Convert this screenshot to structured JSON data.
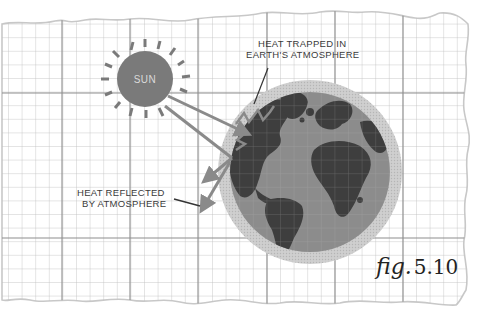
{
  "diagram": {
    "type": "greenhouse-effect-illustration",
    "background": "torn graph paper",
    "sun": {
      "label": "SUN",
      "color": "#7a7a7a",
      "label_color": "#d9d9d9"
    },
    "earth": {
      "ocean_color": "#8c8c8c",
      "land_color": "#3e3e3e",
      "atmosphere_color": "#c9c9c9"
    },
    "arrows_color": "#8a8a8a",
    "grid": {
      "line_color": "#b9b9b9",
      "major_line_color": "#8e8e8e"
    }
  },
  "labels": {
    "heat_trapped_line1": "HEAT TRAPPED IN",
    "heat_trapped_line2": "EARTH'S ATMOSPHERE",
    "heat_reflected_line1": "HEAT REFLECTED",
    "heat_reflected_line2": "BY ATMOSPHERE"
  },
  "figure": {
    "prefix": "fig.",
    "number": "5.10"
  }
}
